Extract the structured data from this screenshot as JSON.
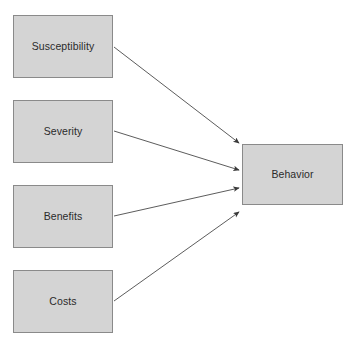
{
  "diagram": {
    "type": "influence-diagram",
    "background_color": "#ffffff",
    "node_fill_color": "#d4d4d4",
    "node_border_color": "#8a8a8a",
    "arrow_color": "#4a4a4a",
    "text_color": "#2b2b2b",
    "antecedent_nodes": [
      {
        "id": "susceptibility",
        "label": "Susceptibility",
        "x": 13,
        "y": 15,
        "width": 100,
        "height": 63
      },
      {
        "id": "severity",
        "label": "Severity",
        "x": 13,
        "y": 100,
        "width": 100,
        "height": 63
      },
      {
        "id": "benefits",
        "label": "Benefits",
        "x": 13,
        "y": 185,
        "width": 100,
        "height": 63
      },
      {
        "id": "costs",
        "label": "Costs",
        "x": 13,
        "y": 270,
        "width": 100,
        "height": 63
      }
    ],
    "outcome_node": {
      "id": "behavior",
      "label": "Behavior",
      "x": 242,
      "y": 144,
      "width": 101,
      "height": 61
    },
    "arrows": [
      {
        "id": "arrow-susceptibility-behavior",
        "from": "susceptibility",
        "to": "behavior",
        "x1": 114,
        "y1": 47,
        "x2": 239,
        "y2": 143
      },
      {
        "id": "arrow-severity-behavior",
        "from": "severity",
        "to": "behavior",
        "x1": 114,
        "y1": 131,
        "x2": 239,
        "y2": 170
      },
      {
        "id": "arrow-benefits-behavior",
        "from": "benefits",
        "to": "behavior",
        "x1": 114,
        "y1": 216,
        "x2": 239,
        "y2": 188
      },
      {
        "id": "arrow-costs-behavior",
        "from": "costs",
        "to": "behavior",
        "x1": 114,
        "y1": 301,
        "x2": 239,
        "y2": 212
      }
    ]
  }
}
